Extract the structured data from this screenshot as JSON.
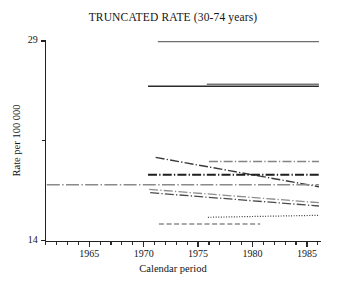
{
  "chart_data": {
    "type": "line",
    "title": "TRUNCATED RATE (30-74 years)",
    "xlabel": "Calendar period",
    "ylabel": "Rate per 100 000",
    "xlim": [
      1961,
      1986.2
    ],
    "ylim": [
      14,
      29
    ],
    "xticks_major": [
      1965,
      1970,
      1975,
      1980,
      1985
    ],
    "xticks_major_labels": [
      "1965",
      "1970",
      "1975",
      "1980",
      "1985"
    ],
    "xticks_minor_step": 1,
    "yticks": [
      14,
      21.5,
      29
    ],
    "yticks_labels": [
      "14",
      "",
      "29"
    ],
    "grid": false,
    "legend": "none",
    "series": [
      {
        "name": "series-1-top-solid",
        "style": "solid",
        "color": "#6e6e6e",
        "width": 1.4,
        "points": [
          [
            1971.3,
            28.95
          ],
          [
            1986.1,
            28.95
          ]
        ]
      },
      {
        "name": "series-2-upper-solid-dark",
        "style": "solid",
        "color": "#2b2b2b",
        "width": 1.6,
        "points": [
          [
            1970.4,
            25.6
          ],
          [
            1986.1,
            25.6
          ]
        ]
      },
      {
        "name": "series-3-upper-solid-gray",
        "style": "solid",
        "color": "#777777",
        "width": 1.5,
        "points": [
          [
            1975.8,
            25.75
          ],
          [
            1986.1,
            25.75
          ]
        ]
      },
      {
        "name": "series-4-mid-dashdot-gray",
        "style": "dashdot",
        "color": "#848484",
        "width": 1.4,
        "points": [
          [
            1976.0,
            19.95
          ],
          [
            1986.1,
            19.95
          ]
        ]
      },
      {
        "name": "series-5-diagonal-descending",
        "style": "dashdot",
        "color": "#3a3a3a",
        "width": 1.4,
        "points": [
          [
            1971.1,
            20.25
          ],
          [
            1986.1,
            18.05
          ]
        ]
      },
      {
        "name": "series-6-mid-dashdot-dark",
        "style": "dashdot",
        "color": "#1e1e1e",
        "width": 1.8,
        "points": [
          [
            1970.4,
            18.95
          ],
          [
            1986.1,
            18.95
          ]
        ]
      },
      {
        "name": "series-7-long-dashdot-gray",
        "style": "longdashdot",
        "color": "#8a8a8a",
        "width": 1.4,
        "points": [
          [
            1961.1,
            18.2
          ],
          [
            1986.1,
            18.2
          ]
        ]
      },
      {
        "name": "series-8-descending-dashdot-gray",
        "style": "dashdot",
        "color": "#8e8e8e",
        "width": 1.3,
        "points": [
          [
            1970.5,
            17.85
          ],
          [
            1986.1,
            16.85
          ]
        ]
      },
      {
        "name": "series-9-descending-dashdot-dark",
        "style": "dashdot",
        "color": "#4a4a4a",
        "width": 1.3,
        "points": [
          [
            1970.6,
            17.6
          ],
          [
            1986.1,
            16.6
          ]
        ]
      },
      {
        "name": "series-10-dotted",
        "style": "dotted",
        "color": "#3a3a3a",
        "width": 1.2,
        "points": [
          [
            1975.9,
            15.75
          ],
          [
            1986.1,
            15.9
          ]
        ]
      },
      {
        "name": "series-11-bottom-dashed",
        "style": "dashed",
        "color": "#8c8c8c",
        "width": 1.6,
        "points": [
          [
            1971.4,
            15.25
          ],
          [
            1980.7,
            15.25
          ]
        ]
      }
    ]
  }
}
